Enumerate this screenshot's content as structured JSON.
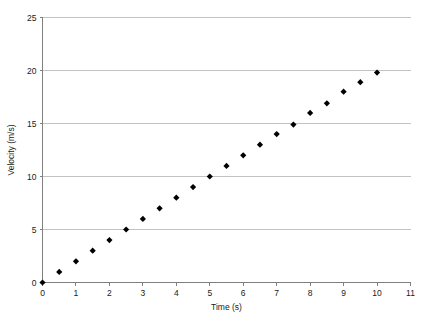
{
  "figure": {
    "background_color": "#ffffff",
    "plot_background_color": "#ffffff",
    "grid_color": "#b4b4b4",
    "axis_color": "#808080",
    "marker_color": "#000000",
    "text_color": "#1a1a1a",
    "caption_fragment": ""
  },
  "chart_data": {
    "type": "scatter",
    "title": "",
    "xlabel": "Time (s)",
    "ylabel": "Velocity (m/s)",
    "xlim": [
      0,
      11
    ],
    "ylim": [
      0,
      25
    ],
    "xticks": [
      0,
      1,
      2,
      3,
      4,
      5,
      6,
      7,
      8,
      9,
      10,
      11
    ],
    "xtick_labels": [
      "0",
      "1",
      "2",
      "3",
      "4",
      "5",
      "6",
      "7",
      "8",
      "9",
      "10",
      "11"
    ],
    "yticks": [
      0,
      5,
      10,
      15,
      20,
      25
    ],
    "ytick_labels": [
      "0",
      "5",
      "10",
      "15",
      "20",
      "25"
    ],
    "grid": "horizontal",
    "legend": "none",
    "marker_style": "diamond",
    "marker_size": 3.1,
    "series": [
      {
        "name": "Velocity vs Time",
        "x": [
          0,
          0.5,
          1,
          1.5,
          2,
          2.5,
          3,
          3.5,
          4,
          4.5,
          5,
          5.5,
          6,
          6.5,
          7,
          7.5,
          8,
          8.5,
          9,
          9.5,
          10
        ],
        "y": [
          0,
          1,
          2,
          3,
          4,
          5,
          6,
          7,
          8,
          9,
          10,
          11,
          12,
          13,
          14,
          14.9,
          16,
          16.9,
          18,
          18.9,
          19.8
        ]
      }
    ]
  }
}
